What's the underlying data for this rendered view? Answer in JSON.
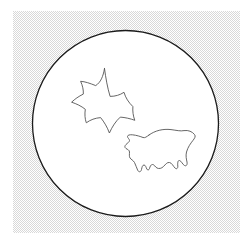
{
  "figure": {
    "canvas": {
      "width": 252,
      "height": 245,
      "background_color": "#ffffff"
    },
    "background_panel": {
      "name": "dotted-texture-panel",
      "x": 13,
      "y": 11,
      "width": 227,
      "height": 222,
      "fill_color": "#ffffff",
      "dot_color": "#d8d8d8",
      "pattern": "fine-checkerboard-dither",
      "pattern_cell_px": 2
    },
    "circle": {
      "name": "outer-circle",
      "center_x": 125.5,
      "center_y": 123.5,
      "radius": 93,
      "fill_color": "#ffffff",
      "stroke_color": "#1a1a1a",
      "stroke_width": 1.3
    },
    "shapes": [
      {
        "name": "concave-star",
        "label": "six-point-concave-star",
        "points": 6,
        "center_x": 103,
        "center_y": 95,
        "stroke_color": "#555555",
        "stroke_width": 0.9,
        "fill_color": "none",
        "path": "M 104.5 68.5 C 103.2 76.6 100.6 82.4 95.7 85.6 C 90.0 83.3 85.0 81.6 80.6 81.3 C 82.6 85.6 83.6 90.1 83.3 94.1 C 78.6 96.4 74.9 99.0 71.6 102.2 C 76.5 103.8 81.2 106.0 85.3 109.3 C 84.6 114.3 84.9 118.8 86.3 122.8 C 90.4 119.8 95.2 118.0 100.6 117.6 C 104.3 122.1 107.3 127.3 109.4 133.0 C 112.3 126.4 115.8 121.2 120.3 117.1 C 125.3 117.5 130.2 118.6 134.8 120.3 C 133.1 115.8 132.5 111.2 132.9 106.6 C 128.5 102.4 125.5 97.6 124.0 92.3 C 119.9 95.0 115.3 96.4 110.1 96.4 C 107.5 87.8 105.8 78.4 104.5 68.5 Z"
      },
      {
        "name": "irregular-blob",
        "label": "bat-like-jagged-blob",
        "center_x": 160,
        "center_y": 155,
        "stroke_color": "#555555",
        "stroke_width": 0.9,
        "fill_color": "none",
        "path": "M 149.0 135.0 C 155.0 130.6 163.0 128.6 171.0 129.6 C 176.5 130.3 180.5 131.4 184.0 130.6 C 188.5 130.0 192.0 131.5 194.5 134.5 C 197.5 138.2 189.5 141.5 186.5 152.0 C 185.5 156.0 186.5 159.5 187.0 162.0 C 187.5 164.5 186.5 166.5 184.5 165.5 C 182.5 164.5 181.5 161.0 179.5 160.5 C 177.8 160.1 177.5 163.0 177.8 166.0 C 178.0 168.5 176.5 169.5 175.0 168.0 C 173.0 166.0 172.0 163.0 169.5 162.5 C 167.0 162.0 165.5 164.5 163.5 166.5 C 161.5 168.5 159.0 169.0 157.0 168.0 C 155.0 167.0 154.5 164.5 152.5 164.5 C 150.8 164.5 150.0 166.5 149.5 168.5 C 149.0 170.2 147.5 170.5 146.8 169.0 C 146.0 167.3 145.5 165.0 144.0 165.0 C 142.5 165.0 142.0 167.0 141.5 169.5 C 141.0 172.0 139.0 172.5 137.8 170.5 C 136.5 168.3 136.0 165.0 134.5 162.5 C 133.0 160.0 131.0 159.5 130.0 158.0 C 129.0 156.5 129.5 154.0 129.5 152.0 C 129.5 150.0 127.5 149.5 126.0 148.5 C 124.5 147.5 124.5 146.0 126.0 144.5 C 127.5 143.0 129.5 142.0 129.5 140.5 C 129.5 139.0 127.5 138.0 127.5 136.5 C 127.5 135.2 129.5 134.5 132.5 134.8 C 136.5 135.2 140.5 136.5 143.0 137.5 C 145.0 138.2 146.5 136.8 149.0 135.0 Z"
      }
    ]
  }
}
